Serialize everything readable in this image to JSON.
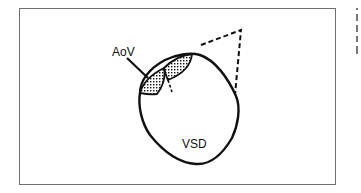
{
  "figure": {
    "labels": {
      "aortic_valve": "AoV",
      "defect": "VSD"
    },
    "colors": {
      "stroke": "#111111",
      "frame": "#707070",
      "background": "#ffffff"
    }
  }
}
